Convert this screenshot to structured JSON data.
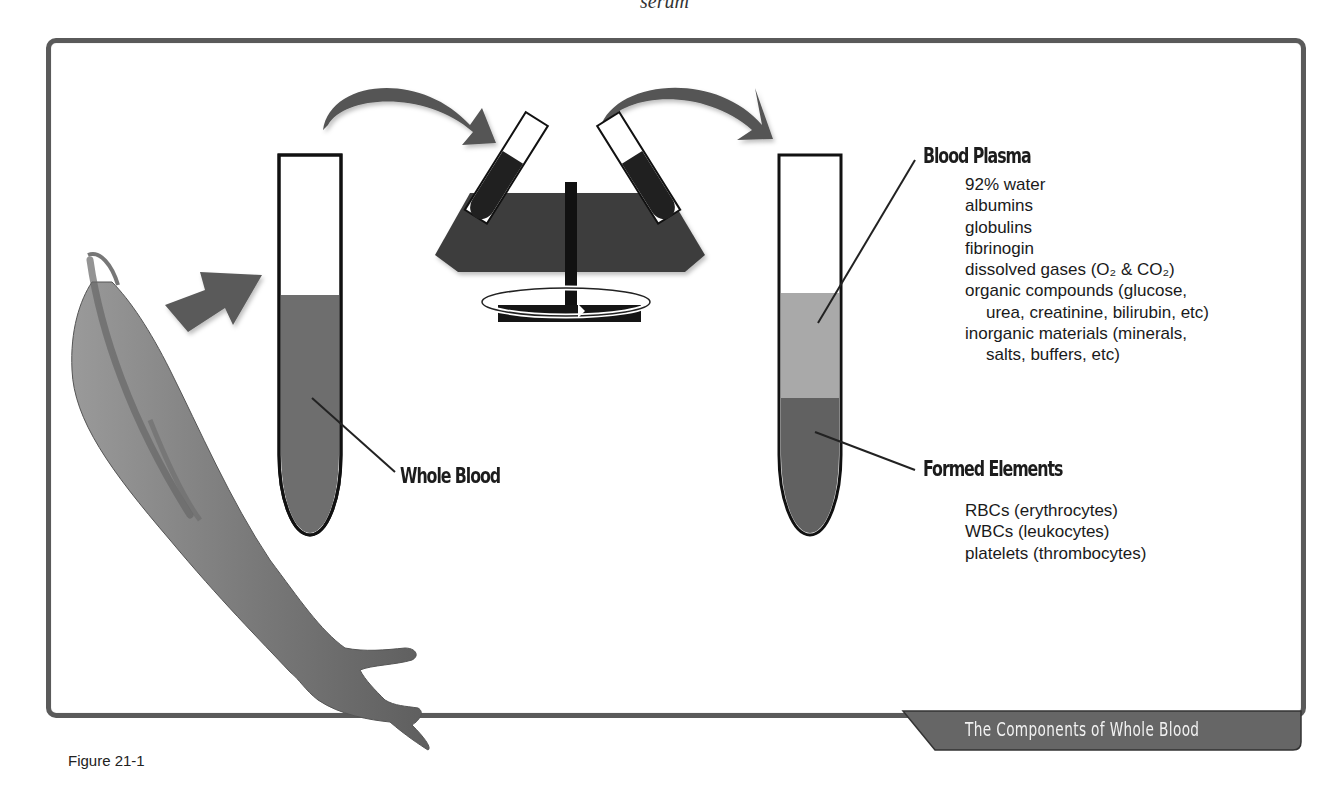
{
  "top_caption": "serum",
  "figure": {
    "label": "Figure 21-1",
    "title": "The Components of Whole Blood"
  },
  "process": {
    "steps": [
      {
        "name": "arm-blood-draw",
        "icon": "arm-icon"
      },
      {
        "name": "whole-blood-tube",
        "icon": "test-tube-icon"
      },
      {
        "name": "centrifuge",
        "icon": "centrifuge-icon"
      },
      {
        "name": "separated-tube",
        "icon": "test-tube-icon"
      }
    ],
    "arrows": [
      "straight-arrow-icon",
      "curved-arrow-icon",
      "curved-arrow-icon"
    ]
  },
  "whole_blood": {
    "label": "Whole Blood"
  },
  "plasma": {
    "label": "Blood Plasma",
    "items": [
      {
        "text": "92% water",
        "indent": false
      },
      {
        "text": "albumins",
        "indent": false
      },
      {
        "text": "globulins",
        "indent": false
      },
      {
        "text": "fibrinogin",
        "indent": false
      },
      {
        "text": "dissolved gases (O₂ & CO₂)",
        "indent": false
      },
      {
        "text": "organic compounds (glucose,",
        "indent": false
      },
      {
        "text": "urea, creatinine, bilirubin, etc)",
        "indent": true
      },
      {
        "text": "inorganic materials (minerals,",
        "indent": false
      },
      {
        "text": "salts, buffers, etc)",
        "indent": true
      }
    ]
  },
  "formed_elements": {
    "label": "Formed Elements",
    "items": [
      {
        "text": "RBCs (erythrocytes)"
      },
      {
        "text": "WBCs (leukocytes)"
      },
      {
        "text": "platelets (thrombocytes)"
      }
    ]
  },
  "colors": {
    "frame": "#5a5a5a",
    "whole_blood": "#6e6e6e",
    "plasma": "#a9a9a9",
    "formed_elements": "#616161",
    "arrow": "#555555",
    "centrifuge": "#3c3c3c",
    "banner": "#666666"
  }
}
